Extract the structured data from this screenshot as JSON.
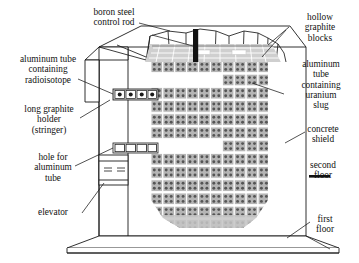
{
  "diagram": {
    "background_color": "#ffffff",
    "line_color": "#1a1a1a",
    "block_fill": "#b9b9b9",
    "block_dot": "#5a5a5a",
    "graphite_top_fill": "#cccccc",
    "control_rod_color": "#111111"
  },
  "labels": {
    "boron_rod": "boron steel\ncontrol rod",
    "hollow_graphite": "hollow\ngraphite\nblocks",
    "alum_radioisotope": "aluminum tube\ncontaining\nradioisotope",
    "alum_uranium": "aluminum\ntube\ncontaining\nuranium\nslug",
    "stringer": "long graphite\nholder\n(stringer)",
    "concrete_shield": "concrete\nshield",
    "hole_alum_tube": "hole for\naluminum\ntube",
    "second_floor": "second\nfloor",
    "elevator": "elevator",
    "first_floor": "first\nfloor"
  },
  "pile": {
    "columns": 10,
    "rows": 12,
    "dots_per_block": 4,
    "gap_rows": [
      1,
      6
    ],
    "notes": "uranium slug lattice in graphite block matrix"
  }
}
